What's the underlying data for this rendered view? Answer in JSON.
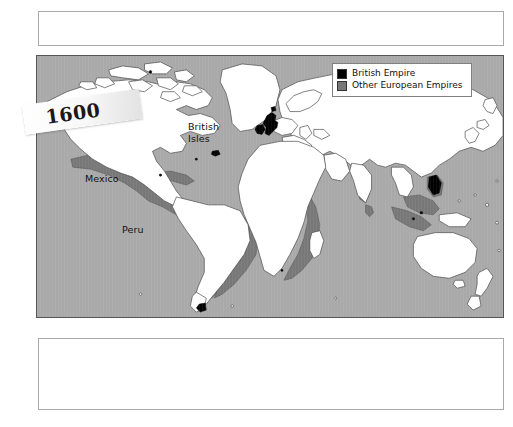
{
  "page": {
    "background_color": "#ffffff",
    "width": 513,
    "height": 427
  },
  "caption_top": {
    "text": "",
    "border_color": "#a9a9a9"
  },
  "caption_bottom": {
    "text": "",
    "border_color": "#a9a9a9"
  },
  "year_banner": {
    "label": "1600"
  },
  "map": {
    "ocean_color": "#a9a9a9",
    "land_color": "#ffffff",
    "british_empire_color": "#000000",
    "other_empires_color": "#787878",
    "coastline_color": "#4a4a4a",
    "border_color": "#555555",
    "labels": [
      {
        "name": "british-isles",
        "text": "British\nIsles"
      },
      {
        "name": "mexico",
        "text": "Mexico"
      },
      {
        "name": "peru",
        "text": "Peru"
      }
    ]
  },
  "legend": {
    "items": [
      {
        "label": "British Empire",
        "color": "#000000"
      },
      {
        "label": "Other European Empires",
        "color": "#787878"
      }
    ]
  }
}
